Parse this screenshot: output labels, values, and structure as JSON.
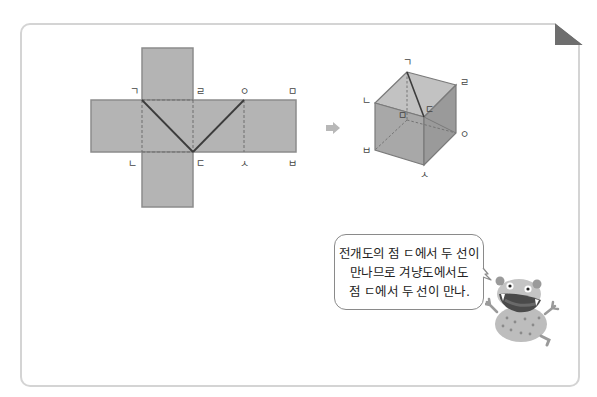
{
  "net": {
    "labels": {
      "g": "ㄱ",
      "r": "ㄹ",
      "o": "ㅇ",
      "m": "ㅁ",
      "n": "ㄴ",
      "d": "ㄷ",
      "s": "ㅅ",
      "b": "ㅂ"
    }
  },
  "arrow": {
    "icon": "right-arrow-icon"
  },
  "cube": {
    "labels": {
      "g": "ㄱ",
      "r": "ㄹ",
      "n": "ㄴ",
      "d": "ㄷ",
      "m": "ㅁ",
      "o": "ㅇ",
      "b": "ㅂ",
      "s": "ㅅ"
    }
  },
  "bubble": {
    "lines": [
      "전개도의 점 ㄷ에서 두 선이",
      "만나므로 겨냥도에서도",
      "점 ㄷ에서 두 선이 만나."
    ]
  },
  "colors": {
    "face_fill": "#b4b4b4",
    "face_stroke": "#8c8c8c",
    "line": "#3c3c3c",
    "card_border": "#d4d4d4"
  }
}
